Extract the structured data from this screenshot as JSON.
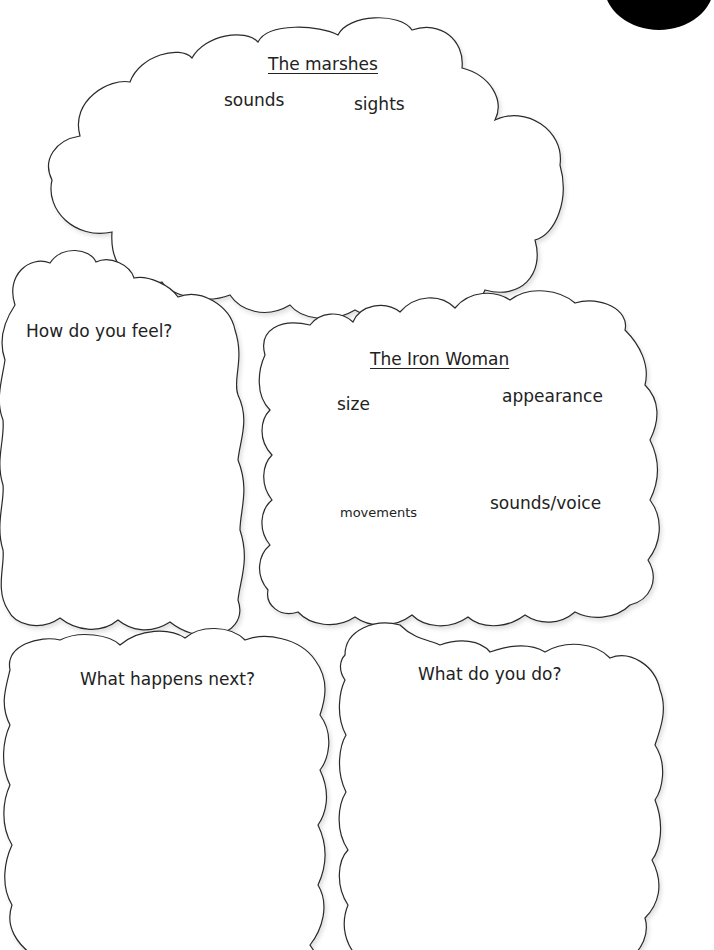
{
  "page_number_badge": {
    "color": "#000000"
  },
  "marshes_cloud": {
    "title": "The marshes",
    "prompts": [
      "sounds",
      "sights"
    ]
  },
  "feel_cloud": {
    "title": "How do you feel?"
  },
  "iron_woman_cloud": {
    "title": "The Iron Woman",
    "prompts": [
      "size",
      "appearance",
      "movements",
      "sounds/voice"
    ]
  },
  "next_cloud": {
    "title": "What happens next?"
  },
  "do_cloud": {
    "title": "What do you do?"
  },
  "colors": {
    "outline": "#2a2a2a",
    "text": "#222222",
    "background": "#ffffff"
  }
}
